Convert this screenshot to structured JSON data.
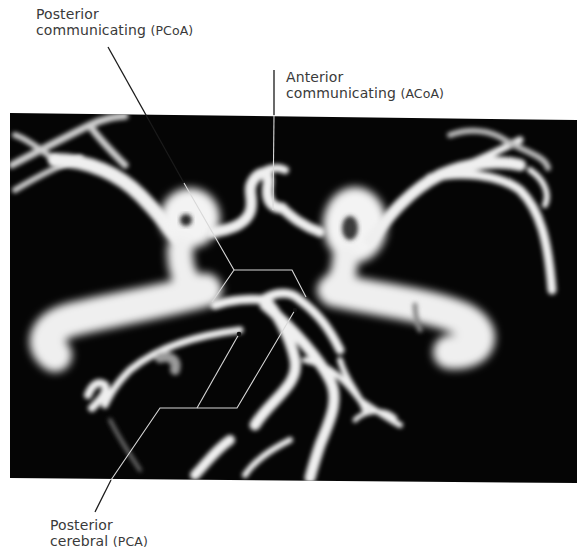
{
  "figure": {
    "background_color": "#000000",
    "vessel_color": "#f2f2f2",
    "leader_line_color_outside": "#1a1a1a",
    "leader_line_color_inside": "#cfcfcf"
  },
  "labels": [
    {
      "id": "pcoa",
      "line1": "Posterior",
      "line2_main": "communicating ",
      "line2_abbr": "(PCoA)"
    },
    {
      "id": "acoa",
      "line1": "Anterior",
      "line2_main": "communicating ",
      "line2_abbr": "(ACoA)"
    },
    {
      "id": "pca",
      "line1": "Posterior",
      "line2_main": "cerebral ",
      "line2_abbr": "(PCA)"
    }
  ]
}
